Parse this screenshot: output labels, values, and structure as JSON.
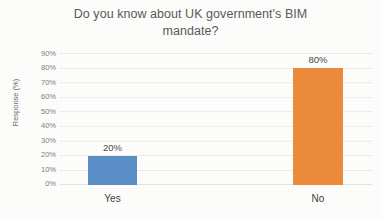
{
  "chart_data": {
    "type": "bar",
    "title": "Do you know about UK government's BIM mandate?",
    "title_line1": "Do you know about UK government's BIM",
    "title_line2": "mandate?",
    "categories": [
      "Yes",
      "No"
    ],
    "values": [
      20,
      80
    ],
    "value_labels": [
      "20%",
      "80%"
    ],
    "xlabel": "",
    "ylabel": "Response (%)",
    "ylim": [
      0,
      90
    ],
    "ytick_values": [
      0,
      10,
      20,
      30,
      40,
      50,
      60,
      70,
      80,
      90
    ],
    "ytick_labels": [
      "0%",
      "10%",
      "20%",
      "30%",
      "40%",
      "50%",
      "60%",
      "70%",
      "80%",
      "90%"
    ],
    "grid": true,
    "legend": false,
    "series": [
      {
        "name": "Response (%)",
        "values": [
          20,
          80
        ],
        "colors": [
          "#5b8fc7",
          "#ed8b3c"
        ]
      }
    ],
    "colors": {
      "bar_yes": "#5b8fc7",
      "bar_no": "#ed8b3c",
      "gridline": "#ededed",
      "axis": "#e2e2e2",
      "title_text": "#5a5a5a",
      "tick_text": "#7d7d7d",
      "category_text": "#3f3f3f",
      "background": "#fdfdfc"
    }
  }
}
